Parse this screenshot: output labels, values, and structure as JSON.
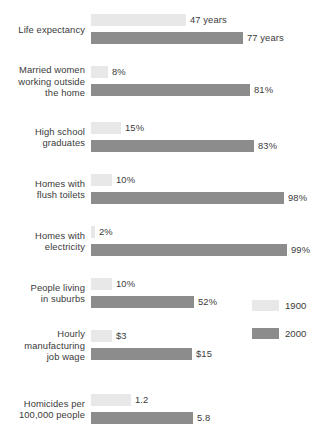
{
  "chart_data": {
    "type": "bar",
    "title": "",
    "subtitle": "",
    "xlabel": "",
    "ylabel": "",
    "orientation": "horizontal",
    "grid": false,
    "legend_position": "right-middle",
    "categories": [
      "Life expectancy",
      "Married women working outside the home",
      "High school graduates",
      "Homes with flush toilets",
      "Homes with electricity",
      "People living in suburbs",
      "Hourly manufacturing job wage",
      "Homicides per 100,000 people"
    ],
    "series": [
      {
        "name": "1900",
        "color": "#e8e8e8",
        "values": [
          47,
          8,
          15,
          10,
          2,
          10,
          3,
          1.2
        ],
        "labels": [
          "47 years",
          "8%",
          "15%",
          "10%",
          "2%",
          "10%",
          "$3",
          "1.2"
        ]
      },
      {
        "name": "2000",
        "color": "#8c8c8c",
        "values": [
          77,
          81,
          83,
          98,
          99,
          52,
          15,
          5.8
        ],
        "labels": [
          "77 years",
          "81%",
          "83%",
          "98%",
          "99%",
          "52%",
          "$15",
          "5.8"
        ]
      }
    ],
    "rows": [
      {
        "label_lines": [
          "Life expectancy"
        ],
        "top": 14,
        "v1900": {
          "text": "47 years",
          "width": 95
        },
        "v2000": {
          "text": "77 years",
          "width": 152
        }
      },
      {
        "label_lines": [
          "Married women",
          "working outside",
          "the home"
        ],
        "top": 66,
        "v1900": {
          "text": "8%",
          "width": 17
        },
        "v2000": {
          "text": "81%",
          "width": 159
        }
      },
      {
        "label_lines": [
          "High school",
          "graduates"
        ],
        "top": 122,
        "v1900": {
          "text": "15%",
          "width": 30
        },
        "v2000": {
          "text": "83%",
          "width": 163
        }
      },
      {
        "label_lines": [
          "Homes with",
          "flush toilets"
        ],
        "top": 174,
        "v1900": {
          "text": "10%",
          "width": 21
        },
        "v2000": {
          "text": "98%",
          "width": 193
        }
      },
      {
        "label_lines": [
          "Homes with",
          "electricity"
        ],
        "top": 226,
        "v1900": {
          "text": "2%",
          "width": 4
        },
        "v2000": {
          "text": "99%",
          "width": 196
        }
      },
      {
        "label_lines": [
          "People living",
          "in suburbs"
        ],
        "top": 278,
        "v1900": {
          "text": "10%",
          "width": 21
        },
        "v2000": {
          "text": "52%",
          "width": 103
        }
      },
      {
        "label_lines": [
          "Hourly",
          "manufacturing",
          "job wage"
        ],
        "top": 330,
        "v1900": {
          "text": "$3",
          "width": 21
        },
        "v2000": {
          "text": "$15",
          "width": 101
        }
      },
      {
        "label_lines": [
          "Homicides per",
          "100,000 people"
        ],
        "top": 394,
        "v1900": {
          "text": "1.2",
          "width": 40
        },
        "v2000": {
          "text": "5.8",
          "width": 102
        }
      }
    ]
  },
  "legend": {
    "items": [
      {
        "label": "1900",
        "swatch": "light-gray-swatch"
      },
      {
        "label": "2000",
        "swatch": "dark-gray-swatch"
      }
    ]
  }
}
